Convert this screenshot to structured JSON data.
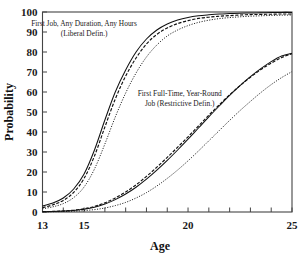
{
  "chart_data": {
    "type": "line",
    "title": "",
    "xlabel": "Age",
    "ylabel": "Probability",
    "xlim": [
      13,
      25
    ],
    "ylim": [
      0,
      100
    ],
    "grid": false,
    "legend_position": "inline-annotations",
    "xticks": [
      13,
      14,
      15,
      16,
      17,
      18,
      19,
      20,
      21,
      22,
      23,
      24,
      25
    ],
    "xtick_labels": [
      "13",
      "",
      "15",
      "",
      "",
      "",
      "",
      "20",
      "",
      "",
      "",
      "",
      "25"
    ],
    "yticks": [
      0,
      10,
      20,
      30,
      40,
      50,
      60,
      70,
      80,
      90,
      100
    ],
    "ytick_labels": [
      "0",
      "10",
      "20",
      "30",
      "40",
      "50",
      "60",
      "70",
      "80",
      "90",
      "100"
    ],
    "annotations": [
      {
        "id": "liberal-label",
        "line1": "First Job, Any Duration, Any Hours",
        "line2": "(Liberal Defin.)",
        "x": 15.0,
        "y": 93.0
      },
      {
        "id": "restrictive-label",
        "line1": "First Full-Time, Year-Round",
        "line2": "Job (Restrictive Defin.)",
        "x": 19.6,
        "y": 58.0
      }
    ],
    "x": [
      13,
      13.5,
      14,
      14.5,
      15,
      15.5,
      16,
      16.5,
      17,
      17.5,
      18,
      18.5,
      19,
      19.5,
      20,
      20.5,
      21,
      21.5,
      22,
      22.5,
      23,
      23.5,
      24,
      24.5,
      25
    ],
    "series": [
      {
        "name": "First Job, Any Duration, Any Hours (Liberal Defin.) - solid",
        "group": "liberal",
        "style": "solid",
        "values": [
          3.0,
          4.5,
          7.0,
          11.5,
          19.0,
          31.0,
          46.0,
          60.0,
          71.0,
          80.0,
          86.5,
          91.0,
          94.0,
          96.0,
          97.3,
          98.1,
          98.6,
          99.0,
          99.2,
          99.4,
          99.5,
          99.6,
          99.7,
          99.8,
          99.8
        ]
      },
      {
        "name": "First Job, Any Duration, Any Hours (Liberal Defin.) - dashed",
        "group": "liberal",
        "style": "dashed",
        "values": [
          2.2,
          3.6,
          5.8,
          9.8,
          16.8,
          28.0,
          42.5,
          56.5,
          68.0,
          77.0,
          84.0,
          88.8,
          92.0,
          94.2,
          95.7,
          96.8,
          97.4,
          97.9,
          98.2,
          98.5,
          98.7,
          98.8,
          98.9,
          99.0,
          99.0
        ]
      },
      {
        "name": "First Job, Any Duration, Any Hours (Liberal Defin.) - dotted",
        "group": "liberal",
        "style": "dotted",
        "values": [
          1.6,
          2.6,
          4.2,
          7.2,
          12.5,
          21.5,
          34.0,
          47.5,
          59.5,
          69.5,
          77.5,
          83.5,
          88.0,
          91.0,
          93.2,
          94.8,
          95.9,
          96.7,
          97.2,
          97.6,
          97.9,
          98.1,
          98.3,
          98.4,
          98.5
        ]
      },
      {
        "name": "First Full-Time, Year-Round Job (Restrictive Defin.) - dashed",
        "group": "restrictive",
        "style": "dashed",
        "values": [
          0.2,
          0.3,
          0.5,
          0.9,
          1.6,
          2.8,
          4.6,
          7.0,
          10.0,
          13.6,
          17.8,
          22.4,
          27.3,
          32.4,
          37.6,
          43.0,
          48.4,
          53.6,
          58.6,
          63.2,
          67.4,
          71.2,
          74.4,
          77.2,
          79.2
        ]
      },
      {
        "name": "First Full-Time, Year-Round Job (Restrictive Defin.) - solid",
        "group": "restrictive",
        "style": "solid",
        "values": [
          0.15,
          0.25,
          0.45,
          0.8,
          1.4,
          2.4,
          4.0,
          6.2,
          9.0,
          12.4,
          16.4,
          20.9,
          25.8,
          31.0,
          36.4,
          42.0,
          47.6,
          53.0,
          58.3,
          63.2,
          67.7,
          71.7,
          75.2,
          78.0,
          79.4
        ]
      },
      {
        "name": "First Full-Time, Year-Round Job (Restrictive Defin.) - dotted",
        "group": "restrictive",
        "style": "dotted",
        "values": [
          0.1,
          0.15,
          0.25,
          0.4,
          0.7,
          1.2,
          2.0,
          3.2,
          4.8,
          7.0,
          9.7,
          13.0,
          16.8,
          21.0,
          25.6,
          30.5,
          35.6,
          40.7,
          45.8,
          50.7,
          55.3,
          59.7,
          63.7,
          67.2,
          70.2
        ]
      }
    ]
  }
}
